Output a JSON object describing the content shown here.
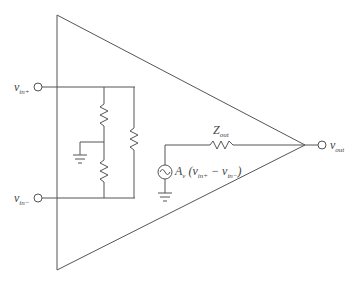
{
  "diagram": {
    "labels": {
      "vin_plus": {
        "main": "v",
        "sub": "in+"
      },
      "vin_minus": {
        "main": "v",
        "sub": "in−"
      },
      "vout": {
        "main": "v",
        "sub": "out"
      },
      "zout": {
        "main": "Z",
        "sub": "out"
      },
      "source_expr": {
        "gain": "A",
        "gain_sub": "v",
        "open": " (v",
        "p_sub": "in+",
        "mid": " − v",
        "m_sub": "in−",
        "close": ")"
      }
    },
    "components": [
      "input resistor top",
      "input resistor bottom",
      "input resistor differential",
      "output impedance Zout",
      "dependent voltage source",
      "ground (input midpoint)",
      "ground (source)"
    ],
    "colors": {
      "line": "#555555",
      "background": "#ffffff"
    }
  }
}
